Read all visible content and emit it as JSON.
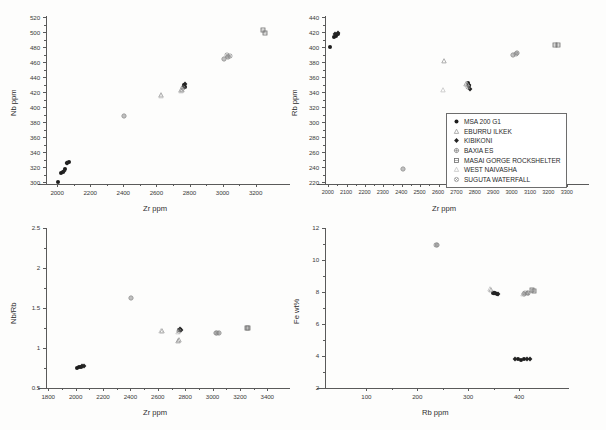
{
  "legend": {
    "position": "top-right-panel-inside",
    "entries": [
      {
        "label": "MSA 200 G1",
        "marker": "filled-circle",
        "color": "#1d1d1d"
      },
      {
        "label": "EBURRU ILKEK",
        "marker": "triangle",
        "color": "#9a9a9a"
      },
      {
        "label": "KIBIKONI",
        "marker": "filled-diamond",
        "color": "#242424"
      },
      {
        "label": "BAXIA ES",
        "marker": "open-circle-cross",
        "color": "#7c7c7c"
      },
      {
        "label": "MASAI GORGE ROCKSHELTER",
        "marker": "square",
        "color": "#6b6b6b"
      },
      {
        "label": "WEST NAIVASHA",
        "marker": "light-triangle",
        "color": "#bdbdbd"
      },
      {
        "label": "SUGUTA WATERFALL",
        "marker": "star-circle",
        "color": "#8a8a8a"
      }
    ]
  },
  "chart_data": [
    {
      "id": "panel-nb-vs-zr",
      "type": "scatter",
      "title": "",
      "xlabel": "Zr ppm",
      "ylabel": "Nb ppm",
      "xlim": [
        1930,
        3320
      ],
      "ylim": [
        298,
        522
      ],
      "xticks": [
        2000,
        2200,
        2400,
        2600,
        2800,
        3000,
        3200
      ],
      "yticks": [
        300,
        320,
        340,
        360,
        380,
        400,
        420,
        440,
        460,
        480,
        500,
        520
      ],
      "grid": false,
      "series": [
        {
          "name": "MSA 200 G1",
          "marker": "filled-circle",
          "color": "#1d1d1d",
          "points": [
            [
              2005,
              301
            ],
            [
              2018,
              313
            ],
            [
              2030,
              314
            ],
            [
              2042,
              318
            ],
            [
              2055,
              326
            ],
            [
              2066,
              327
            ],
            [
              2762,
              430
            ],
            [
              2768,
              428
            ]
          ]
        },
        {
          "name": "EBURRU ILKEK",
          "marker": "triangle",
          "color": "#9a9a9a",
          "points": [
            [
              2628,
              417
            ],
            [
              2745,
              423
            ],
            [
              2752,
              424
            ]
          ]
        },
        {
          "name": "KIBIKONI",
          "marker": "filled-diamond",
          "color": "#242424",
          "points": [
            [
              2038,
              316
            ],
            [
              2058,
              326
            ],
            [
              2765,
              429
            ],
            [
              2770,
              431
            ]
          ]
        },
        {
          "name": "BAXIA ES",
          "marker": "open-circle-cross",
          "color": "#7c7c7c",
          "points": [
            [
              2402,
              389
            ],
            [
              3005,
              465
            ],
            [
              3030,
              468
            ]
          ]
        },
        {
          "name": "MASAI GORGE ROCKSHELTER",
          "marker": "square",
          "color": "#6b6b6b",
          "points": [
            [
              3240,
              504
            ],
            [
              3252,
              500
            ]
          ]
        },
        {
          "name": "WEST NAIVASHA",
          "marker": "light-triangle",
          "color": "#bdbdbd",
          "points": [
            [
              2625,
              416
            ],
            [
              2748,
              422
            ]
          ]
        },
        {
          "name": "SUGUTA WATERFALL",
          "marker": "star-circle",
          "color": "#8a8a8a",
          "points": [
            [
              3022,
              470
            ],
            [
              3040,
              469
            ],
            [
              2758,
              426
            ]
          ]
        }
      ]
    },
    {
      "id": "panel-rb-vs-zr",
      "type": "scatter",
      "title": "",
      "xlabel": "Zr ppm",
      "ylabel": "Rb ppm",
      "xlim": [
        1980,
        3340
      ],
      "ylim": [
        218,
        442
      ],
      "xticks": [
        2000,
        2100,
        2200,
        2300,
        2400,
        2500,
        2600,
        2700,
        2800,
        2900,
        3000,
        3100,
        3200,
        3300
      ],
      "yticks": [
        220,
        240,
        260,
        280,
        300,
        320,
        340,
        360,
        380,
        400,
        420,
        440
      ],
      "grid": false,
      "series": [
        {
          "name": "MSA 200 G1",
          "marker": "filled-circle",
          "color": "#1d1d1d",
          "points": [
            [
              2005,
              401
            ],
            [
              2030,
              414
            ],
            [
              2042,
              416
            ],
            [
              2052,
              418
            ],
            [
              2760,
              353
            ],
            [
              2766,
              349
            ]
          ]
        },
        {
          "name": "EBURRU ILKEK",
          "marker": "triangle",
          "color": "#9a9a9a",
          "points": [
            [
              2630,
              382
            ],
            [
              2748,
              352
            ]
          ]
        },
        {
          "name": "KIBIKONI",
          "marker": "filled-diamond",
          "color": "#242424",
          "points": [
            [
              2036,
              418
            ],
            [
              2048,
              420
            ],
            [
              2762,
              350
            ],
            [
              2768,
              345
            ]
          ]
        },
        {
          "name": "BAXIA ES",
          "marker": "open-circle-cross",
          "color": "#7c7c7c",
          "points": [
            [
              2402,
              238
            ],
            [
              3000,
              390
            ],
            [
              3022,
              393
            ]
          ]
        },
        {
          "name": "MASAI GORGE ROCKSHELTER",
          "marker": "square",
          "color": "#6b6b6b",
          "points": [
            [
              3232,
              404
            ],
            [
              3248,
              404
            ]
          ]
        },
        {
          "name": "WEST NAIVASHA",
          "marker": "light-triangle",
          "color": "#bdbdbd",
          "points": [
            [
              2622,
              344
            ],
            [
              2752,
              351
            ]
          ]
        },
        {
          "name": "SUGUTA WATERFALL",
          "marker": "star-circle",
          "color": "#8a8a8a",
          "points": [
            [
              3018,
              392
            ],
            [
              2756,
              347
            ]
          ]
        }
      ]
    },
    {
      "id": "panel-nbrb-vs-zr",
      "type": "scatter",
      "title": "",
      "xlabel": "Zr ppm",
      "ylabel": "Nb/Rb",
      "xlim": [
        1780,
        3460
      ],
      "ylim": [
        0.5,
        2.5
      ],
      "xticks": [
        1800,
        2000,
        2200,
        2400,
        2600,
        2800,
        3000,
        3200,
        3400
      ],
      "yticks": [
        0.5,
        1.0,
        1.5,
        2.0,
        2.5
      ],
      "grid": false,
      "series": [
        {
          "name": "MSA 200 G1",
          "marker": "filled-circle",
          "color": "#1d1d1d",
          "points": [
            [
              2005,
              0.75
            ],
            [
              2020,
              0.76
            ],
            [
              2032,
              0.76
            ],
            [
              2755,
              1.22
            ],
            [
              2762,
              1.23
            ]
          ]
        },
        {
          "name": "EBURRU ILKEK",
          "marker": "triangle",
          "color": "#9a9a9a",
          "points": [
            [
              2628,
              1.21
            ],
            [
              2742,
              1.09
            ],
            [
              2748,
              1.1
            ]
          ]
        },
        {
          "name": "KIBIKONI",
          "marker": "filled-diamond",
          "color": "#242424",
          "points": [
            [
              2045,
              0.78
            ],
            [
              2058,
              0.78
            ],
            [
              2758,
              1.24
            ],
            [
              2765,
              1.22
            ]
          ]
        },
        {
          "name": "BAXIA ES",
          "marker": "open-circle-cross",
          "color": "#7c7c7c",
          "points": [
            [
              2400,
              1.63
            ],
            [
              3022,
              1.19
            ],
            [
              3042,
              1.19
            ]
          ]
        },
        {
          "name": "MASAI GORGE ROCKSHELTER",
          "marker": "square",
          "color": "#6b6b6b",
          "points": [
            [
              3245,
              1.25
            ],
            [
              3258,
              1.25
            ]
          ]
        },
        {
          "name": "WEST NAIVASHA",
          "marker": "light-triangle",
          "color": "#bdbdbd",
          "points": [
            [
              2622,
              1.21
            ],
            [
              2745,
              1.2
            ]
          ]
        },
        {
          "name": "SUGUTA WATERFALL",
          "marker": "star-circle",
          "color": "#8a8a8a",
          "points": [
            [
              3032,
              1.19
            ],
            [
              2752,
              1.21
            ]
          ]
        }
      ]
    },
    {
      "id": "panel-fe-vs-rb",
      "type": "scatter",
      "title": "",
      "xlabel": "Rb ppm",
      "ylabel": "Fe wt%",
      "xlim": [
        18,
        470
      ],
      "ylim": [
        2,
        12
      ],
      "xticks": [
        100,
        200,
        300,
        400
      ],
      "yticks": [
        2,
        4,
        6,
        8,
        10,
        12
      ],
      "grid": false,
      "series": [
        {
          "name": "MSA 200 G1",
          "marker": "filled-circle",
          "color": "#1d1d1d",
          "points": [
            [
              348,
              7.95
            ],
            [
              352,
              7.92
            ],
            [
              356,
              7.9
            ],
            [
              398,
              3.8
            ],
            [
              404,
              3.78
            ],
            [
              410,
              3.82
            ]
          ]
        },
        {
          "name": "EBURRU ILKEK",
          "marker": "triangle",
          "color": "#9a9a9a",
          "points": [
            [
              344,
              8.15
            ],
            [
              414,
              7.95
            ]
          ]
        },
        {
          "name": "KIBIKONI",
          "marker": "filled-diamond",
          "color": "#242424",
          "points": [
            [
              350,
              7.94
            ],
            [
              358,
              7.88
            ],
            [
              392,
              3.8
            ],
            [
              414,
              3.82
            ],
            [
              420,
              3.8
            ]
          ]
        },
        {
          "name": "BAXIA ES",
          "marker": "open-circle-cross",
          "color": "#7c7c7c",
          "points": [
            [
              238,
              10.95
            ],
            [
              410,
              7.9
            ],
            [
              416,
              7.92
            ]
          ]
        },
        {
          "name": "MASAI GORGE ROCKSHELTER",
          "marker": "square",
          "color": "#6b6b6b",
          "points": [
            [
              424,
              8.1
            ],
            [
              428,
              8.05
            ]
          ]
        },
        {
          "name": "WEST NAIVASHA",
          "marker": "light-triangle",
          "color": "#bdbdbd",
          "points": [
            [
              342,
              8.18
            ],
            [
              408,
              7.88
            ]
          ]
        },
        {
          "name": "SUGUTA WATERFALL",
          "marker": "star-circle",
          "color": "#8a8a8a",
          "points": [
            [
              236,
              10.94
            ],
            [
              412,
              7.93
            ]
          ]
        }
      ]
    }
  ]
}
